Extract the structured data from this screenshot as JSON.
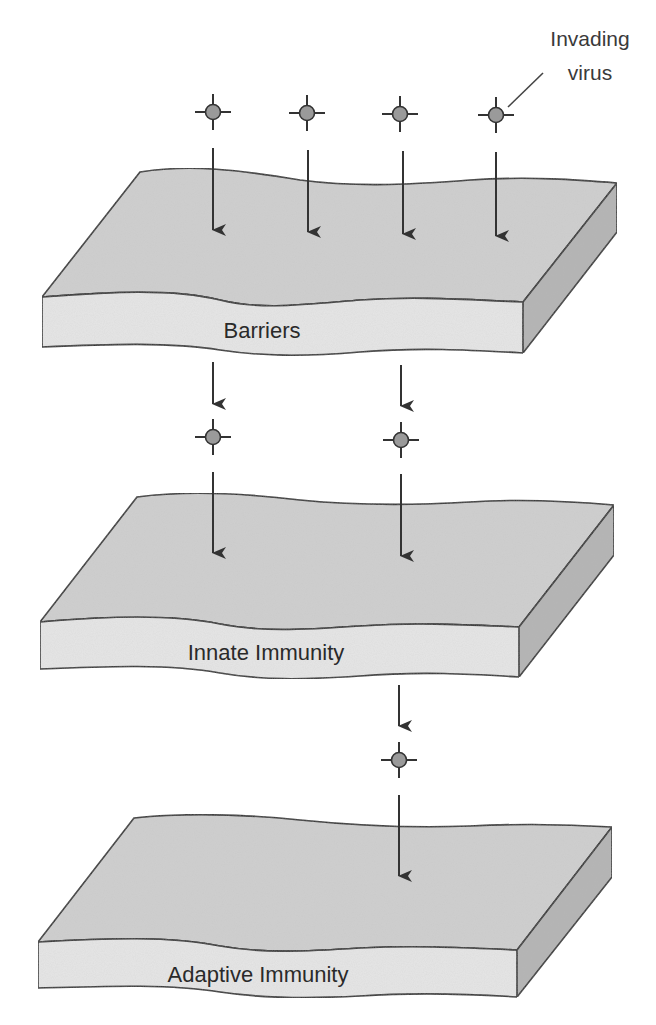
{
  "diagram": {
    "type": "layered-defense-diagram",
    "callout": {
      "line1": "Invading",
      "line2": "virus",
      "points_to": "virus-top-4"
    },
    "layers": [
      {
        "id": "barriers",
        "label": "Barriers",
        "order": 1
      },
      {
        "id": "innate",
        "label": "Innate Immunity",
        "order": 2
      },
      {
        "id": "adaptive",
        "label": "Adaptive Immunity",
        "order": 3
      }
    ],
    "flow": [
      {
        "stage": "entering-barriers",
        "virus_count": 4
      },
      {
        "stage": "entering-innate-immunity",
        "virus_count": 2
      },
      {
        "stage": "entering-adaptive-immunity",
        "virus_count": 1
      }
    ],
    "colors": {
      "slab_top": "#cfcfcf",
      "slab_front": "#e6e6e6",
      "slab_side": "#b4b4b4",
      "outline": "#2b2b2b",
      "arrow": "#333333",
      "virus_fill": "#9a9a9a",
      "background": "#ffffff"
    }
  }
}
